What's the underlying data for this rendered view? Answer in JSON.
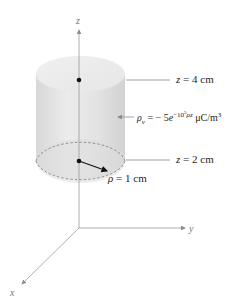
{
  "figure": {
    "type": "cylindrical charge distribution",
    "axes": {
      "z_label": "z",
      "y_label": "y",
      "x_label": "x"
    },
    "labels": {
      "top_plane": {
        "var": "z",
        "eq": "=",
        "value": "4 cm"
      },
      "bottom_plane": {
        "var": "z",
        "eq": "=",
        "value": "2 cm"
      },
      "radius": {
        "var": "ρ",
        "eq": "=",
        "value": "1 cm"
      },
      "charge_density": {
        "var": "ρ",
        "subscript": "v",
        "eq": "= − 5",
        "base": "e",
        "exponent": "−10",
        "exponent_power": "5",
        "exponent_tail": "ρz",
        "units": " μC/m",
        "units_power": "3"
      }
    },
    "colors": {
      "cylinder_fill": "#e4e4e4",
      "top_face": "#ececec",
      "bottom_face": "#d9d9d9",
      "axis_line": "#9a9a9a",
      "leader_line": "#8c8c8c",
      "dot": "#111111"
    }
  }
}
